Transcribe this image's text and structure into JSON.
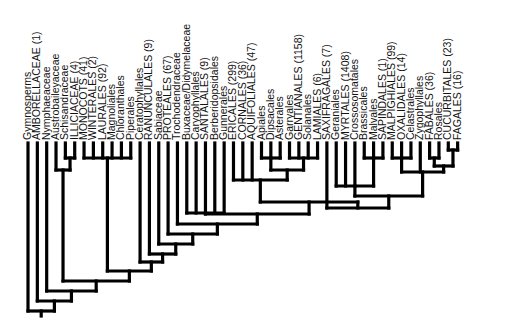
{
  "diagram": {
    "type": "cladogram",
    "orientation": "tips-up",
    "colors": {
      "line": "#000000",
      "text": "#111111",
      "background": "#ffffff"
    },
    "taxa": [
      "Gymnosperms",
      "AMBORELLACEAE (1)",
      "Nymphaeaceae",
      "Austrobaileyaceae",
      "Schisandraceae",
      "ILLICIACEAE (4)",
      "MONOCOTS (41)",
      "WINTERALES (2)",
      "LAURALES (92)",
      "Magnoliales",
      "Chloranthales",
      "Piperales",
      "Ceratophyllales",
      "RANUNCULALES (9)",
      "Sabiaceae",
      "PROTEALES (67)",
      "Trochodendraceae",
      "Buxaceae/Didymelaceae",
      "Caryophyllales",
      "SANTALALES (9)",
      "Berberidopsidales",
      "Gunnerales",
      "ERICALES (299)",
      "CORNALES (36)",
      "AQUIFOLIALES (47)",
      "Apiales",
      "Dipsacales",
      "Asterales",
      "Garryales",
      "GENTIANALES (1158)",
      "Solanales",
      "LAMIALES (6)",
      "SAXIFRAGALES (7)",
      "Geraniales",
      "MYRTALES (1408)",
      "Crossosomatales",
      "Brassicales",
      "Malvales",
      "SAPINDALES (1)",
      "MALPIGHIALES (99)",
      "OXALIDALES (14)",
      "Celastrales",
      "Zygophyllales",
      "FABALES (36)",
      "Rosales",
      "CUCURBITALES (23)",
      "FAGALES (16)"
    ],
    "layout": {
      "first_tip_x": 28,
      "tip_spacing": 9.34,
      "tip_top_y": 143,
      "label_baseline_offset": 3
    },
    "clades": [
      {
        "name": "schis-illic",
        "members": [
          4,
          5
        ],
        "y": 158
      },
      {
        "name": "magnoliids",
        "members": [
          6,
          7,
          8,
          9,
          10,
          11
        ],
        "y": 158
      },
      {
        "name": "austro-clade",
        "members": [
          3,
          "schis-illic"
        ],
        "y": 170
      },
      {
        "name": "core-eudicots-crown",
        "members": [
          17,
          18,
          19,
          20,
          21
        ],
        "y": 213
      },
      {
        "name": "aster-a",
        "members": [
          25,
          26,
          27
        ],
        "y": 158
      },
      {
        "name": "aster-b",
        "members": [
          28,
          29,
          30,
          31
        ],
        "y": 158
      },
      {
        "name": "asterids-core",
        "members": [
          "aster-a",
          "aster-b"
        ],
        "y": 170
      },
      {
        "name": "asterids",
        "members": [
          22,
          23,
          24,
          "asterids-core"
        ],
        "y": 180
      },
      {
        "name": "malvids-a",
        "members": [
          36,
          37,
          38
        ],
        "y": 158
      },
      {
        "name": "malvids",
        "members": [
          33,
          34,
          35,
          "malvids-a"
        ],
        "y": 186
      },
      {
        "name": "fab-a",
        "members": [
          39,
          40,
          41
        ],
        "y": 158
      },
      {
        "name": "fab-b",
        "members": [
          43,
          44
        ],
        "y": 158
      },
      {
        "name": "fab-c",
        "members": [
          45,
          46
        ],
        "y": 150
      },
      {
        "name": "fab-d",
        "members": [
          "fab-b",
          "fab-c"
        ],
        "y": 166
      },
      {
        "name": "fab-e",
        "members": [
          "fab-a",
          42,
          "fab-d"
        ],
        "y": 172
      },
      {
        "name": "rosids",
        "members": [
          "malvids",
          "fab-e"
        ],
        "y": 196
      },
      {
        "name": "rosids-sax",
        "members": [
          32,
          "rosids"
        ],
        "y": 208
      },
      {
        "name": "core-eudicots",
        "members": [
          "asterids",
          "rosids-sax"
        ],
        "y": 202
      },
      {
        "name": "eudicot-a",
        "members": [
          "core-eudicots-crown",
          "core-eudicots"
        ],
        "y": 214
      },
      {
        "name": "eudicot-b",
        "members": [
          16,
          "eudicot-a"
        ],
        "y": 224
      },
      {
        "name": "eudicot-c",
        "members": [
          15,
          "eudicot-b"
        ],
        "y": 234
      },
      {
        "name": "eudicot-d",
        "members": [
          14,
          "eudicot-c"
        ],
        "y": 244
      },
      {
        "name": "eudicots",
        "members": [
          13,
          "eudicot-d"
        ],
        "y": 254
      },
      {
        "name": "mesangio-a",
        "members": [
          12,
          "eudicots"
        ],
        "y": 262
      },
      {
        "name": "mesangio",
        "members": [
          "magnoliids",
          "mesangio-a"
        ],
        "y": 271
      },
      {
        "name": "angio-a",
        "members": [
          "austro-clade",
          "mesangio"
        ],
        "y": 281
      },
      {
        "name": "angio-b",
        "members": [
          2,
          "angio-a"
        ],
        "y": 291
      },
      {
        "name": "angiosperms",
        "members": [
          1,
          "angio-b"
        ],
        "y": 301
      },
      {
        "name": "root",
        "members": [
          0,
          "angiosperms"
        ],
        "y": 311
      }
    ],
    "root_stem_bottom_y": 316
  }
}
